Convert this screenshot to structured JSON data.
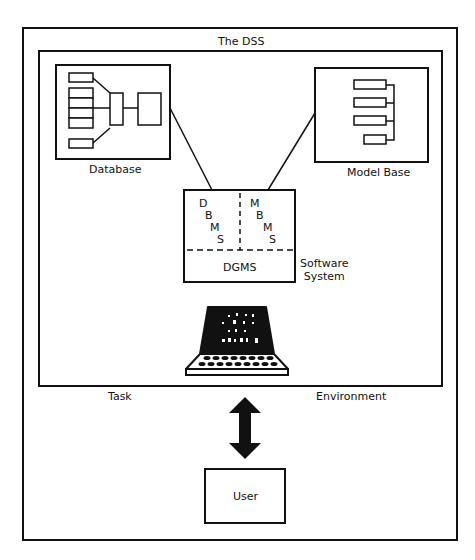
{
  "diagram": {
    "outer_label": "The DSS",
    "components": {
      "database": {
        "label": "Database"
      },
      "model_base": {
        "label": "Model Base"
      },
      "dbms_letters": [
        "D",
        "B",
        "M",
        "S"
      ],
      "mbms_letters": [
        "M",
        "B",
        "M",
        "S"
      ],
      "dgms": {
        "label": "DGMS"
      },
      "software_system": {
        "line1": "Software",
        "line2": "System"
      }
    },
    "bottom_labels": {
      "task": "Task",
      "environment": "Environment"
    },
    "user": {
      "label": "User"
    },
    "colors": {
      "ink": "#111111",
      "background": "#ffffff"
    }
  }
}
